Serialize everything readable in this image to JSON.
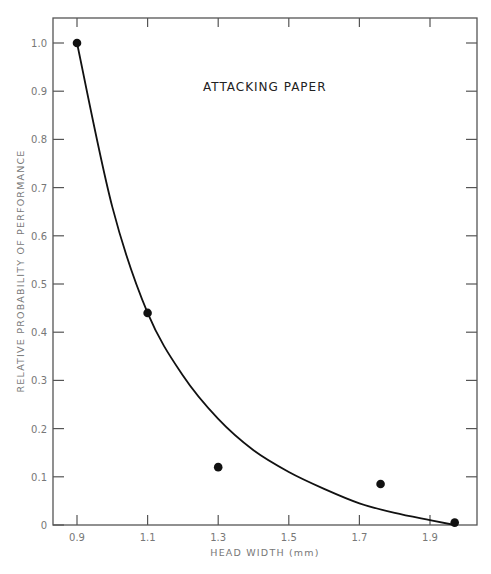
{
  "chart_data": {
    "type": "scatter",
    "title": "ATTACKING PAPER",
    "xlabel": "HEAD WIDTH (mm)",
    "ylabel": "RELATIVE PROBABILITY OF PERFORMANCE",
    "xlim": [
      0.83,
      2.03
    ],
    "ylim": [
      0,
      1.05
    ],
    "x_ticks": [
      "0.9",
      "1.1",
      "1.3",
      "1.5",
      "1.7",
      "1.9"
    ],
    "y_ticks": [
      "0",
      "0.1",
      "0.2",
      "0.3",
      "0.4",
      "0.5",
      "0.6",
      "0.7",
      "0.8",
      "0.9",
      "1.0"
    ],
    "grid": false,
    "legend": null,
    "series": [
      {
        "name": "observed",
        "type": "scatter",
        "x": [
          0.9,
          1.1,
          1.3,
          1.76,
          1.97
        ],
        "y": [
          1.0,
          0.44,
          0.12,
          0.085,
          0.005
        ]
      },
      {
        "name": "fitted curve",
        "type": "line",
        "x": [
          0.9,
          1.0,
          1.1,
          1.2,
          1.3,
          1.4,
          1.5,
          1.6,
          1.7,
          1.8,
          1.9,
          1.97
        ],
        "y": [
          1.0,
          0.66,
          0.44,
          0.31,
          0.22,
          0.155,
          0.11,
          0.075,
          0.045,
          0.025,
          0.01,
          0.0
        ]
      }
    ]
  }
}
